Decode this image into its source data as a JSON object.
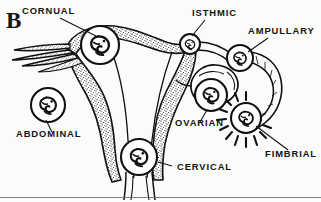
{
  "figure": {
    "panel_letter": "B",
    "background_color": "#fbfbfa",
    "ink_color": "#111111",
    "width": 321,
    "height": 202
  },
  "labels": [
    {
      "id": "cornual",
      "text": "CORNUAL",
      "x": 22,
      "y": 14,
      "anchor": "start"
    },
    {
      "id": "isthmic",
      "text": "ISTHMIC",
      "x": 192,
      "y": 16,
      "anchor": "start"
    },
    {
      "id": "ampullary",
      "text": "AMPULLARY",
      "x": 248,
      "y": 34,
      "anchor": "start"
    },
    {
      "id": "abdominal",
      "text": "ABDOMINAL",
      "x": 16,
      "y": 137,
      "anchor": "start"
    },
    {
      "id": "ovarian",
      "text": "OVARIAN",
      "x": 175,
      "y": 126,
      "anchor": "start"
    },
    {
      "id": "fimbrial",
      "text": "FIMBRIAL",
      "x": 265,
      "y": 157,
      "anchor": "start"
    },
    {
      "id": "cervical",
      "text": "CERVICAL",
      "x": 177,
      "y": 170,
      "anchor": "start"
    }
  ],
  "implantation_sites": [
    {
      "id": "cornual",
      "label": "CORNUAL",
      "cx": 100,
      "cy": 45,
      "r": 19
    },
    {
      "id": "isthmic",
      "label": "ISTHMIC",
      "cx": 190,
      "cy": 44,
      "r": 10
    },
    {
      "id": "ampullary",
      "label": "AMPULLARY",
      "cx": 240,
      "cy": 58,
      "r": 13
    },
    {
      "id": "abdominal",
      "label": "ABDOMINAL",
      "cx": 48,
      "cy": 105,
      "r": 17
    },
    {
      "id": "ovarian",
      "label": "OVARIAN",
      "cx": 211,
      "cy": 95,
      "r": 16
    },
    {
      "id": "fimbrial",
      "label": "FIMBRIAL",
      "cx": 246,
      "cy": 118,
      "r": 15
    },
    {
      "id": "cervical",
      "label": "CERVICAL",
      "cx": 139,
      "cy": 157,
      "r": 18
    }
  ]
}
